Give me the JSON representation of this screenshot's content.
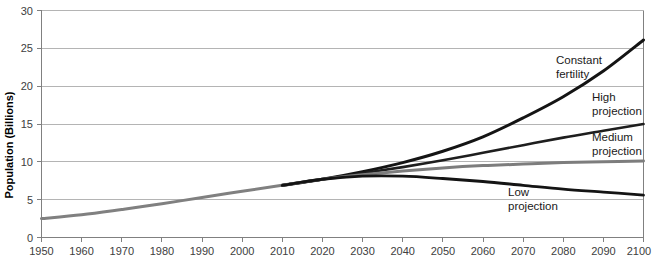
{
  "chart_data": {
    "type": "line",
    "title": "",
    "xlabel": "",
    "ylabel": "Population (Billions)",
    "xlim": [
      1950,
      2100
    ],
    "ylim": [
      0,
      30
    ],
    "grid": true,
    "legend_position": "inline-annotations",
    "x_ticks": [
      1950,
      1960,
      1970,
      1980,
      1990,
      2000,
      2010,
      2020,
      2030,
      2040,
      2050,
      2060,
      2070,
      2080,
      2090,
      2100
    ],
    "y_ticks": [
      0,
      5,
      10,
      15,
      20,
      25,
      30
    ],
    "x": [
      1950,
      1960,
      1970,
      1980,
      1990,
      2000,
      2010,
      2020,
      2030,
      2040,
      2050,
      2060,
      2070,
      2080,
      2090,
      2100
    ],
    "series": [
      {
        "name": "Historical",
        "label": "",
        "color": "#808080",
        "width": 3.0,
        "values": [
          2.5,
          3.0,
          3.7,
          4.45,
          5.3,
          6.1,
          6.9,
          7.7,
          null,
          null,
          null,
          null,
          null,
          null,
          null,
          null
        ]
      },
      {
        "name": "Constant fertility",
        "label": "Constant\nfertility",
        "color": "#141414",
        "width": 3.0,
        "values": [
          null,
          null,
          null,
          null,
          null,
          null,
          6.9,
          7.7,
          8.7,
          9.9,
          11.4,
          13.3,
          15.8,
          18.6,
          22.0,
          26.1
        ]
      },
      {
        "name": "High projection",
        "label": "High\nprojection",
        "color": "#1e1e1e",
        "width": 2.6,
        "values": [
          null,
          null,
          null,
          null,
          null,
          null,
          6.9,
          7.7,
          8.5,
          9.3,
          10.2,
          11.2,
          12.2,
          13.2,
          14.1,
          15.0
        ]
      },
      {
        "name": "Medium projection",
        "label": "Medium\nprojection",
        "color": "#7d7d7d",
        "width": 3.0,
        "values": [
          null,
          null,
          null,
          null,
          null,
          null,
          6.9,
          7.7,
          8.3,
          8.8,
          9.2,
          9.5,
          9.7,
          9.9,
          10.0,
          10.1
        ]
      },
      {
        "name": "Low projection",
        "label": "Low\nprojection",
        "color": "#141414",
        "width": 2.8,
        "values": [
          null,
          null,
          null,
          null,
          null,
          null,
          6.9,
          7.7,
          8.1,
          8.1,
          7.8,
          7.4,
          6.9,
          6.4,
          6.0,
          5.6
        ]
      }
    ],
    "annotations": [
      {
        "id": "constant-fertility",
        "lines": [
          "Constant",
          "fertility"
        ],
        "x": 556,
        "y": 64
      },
      {
        "id": "high-projection",
        "lines": [
          "High",
          "projection"
        ],
        "x": 592,
        "y": 101
      },
      {
        "id": "medium-projection",
        "lines": [
          "Medium",
          "projection"
        ],
        "x": 592,
        "y": 141
      },
      {
        "id": "low-projection",
        "lines": [
          "Low",
          "projection"
        ],
        "x": 508,
        "y": 196
      }
    ]
  },
  "axis": {
    "y_title": "Population (Billions)",
    "y_tick_labels": [
      "0",
      "5",
      "10",
      "15",
      "20",
      "25",
      "30"
    ],
    "x_tick_labels": [
      "1950",
      "1960",
      "1970",
      "1980",
      "1990",
      "2000",
      "2010",
      "2020",
      "2030",
      "2040",
      "2050",
      "2060",
      "2070",
      "2080",
      "2090",
      "2100"
    ]
  },
  "colors": {
    "gridline": "#b4b4b4",
    "axis": "#808080",
    "text": "#404040",
    "background": "#ffffff"
  }
}
